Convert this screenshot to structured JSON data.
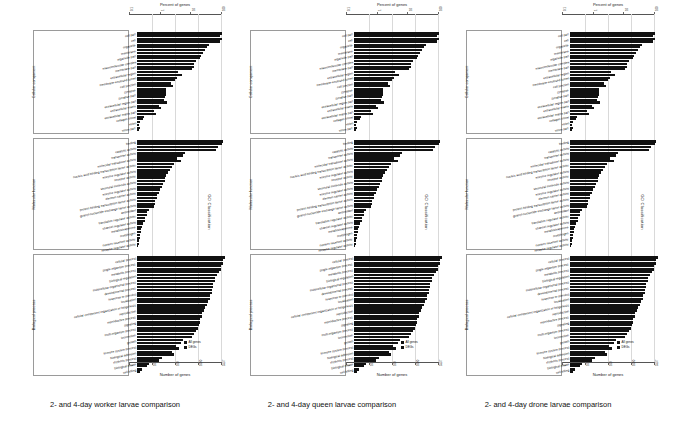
{
  "figure": {
    "panels": [
      {
        "caption": "2- and 4-day worker larvae comparison"
      },
      {
        "caption": "2- and 4-day queen larvae comparison"
      },
      {
        "caption": "2- and 4-day drone larvae comparison"
      }
    ],
    "axis_titles": {
      "top": "Percent of genes",
      "bottom": "Number of genes",
      "right": "GO Classification"
    },
    "group_labels": [
      "Cellular component",
      "Molecular function",
      "Biological process"
    ],
    "legend": [
      {
        "label": "All genes",
        "color": "#111111"
      },
      {
        "label": "DEGs",
        "color": "#111111"
      }
    ]
  },
  "chart_data": {
    "type": "bar",
    "title": "",
    "xlabel": "Number of genes",
    "ylabel": "GO Classification",
    "orientation": "horizontal",
    "top_axis": {
      "label": "Percent of genes",
      "ticks": [
        "0.1",
        "1",
        "10",
        "100"
      ],
      "scale": "log"
    },
    "bottom_axis": {
      "label": "Number of genes",
      "ticks": [
        "1",
        "10",
        "100",
        "1000",
        "5537"
      ],
      "scale": "log"
    },
    "legend": [
      "All genes",
      "DEGs"
    ],
    "legend_position": "bottom-right",
    "grid": true,
    "groups": [
      {
        "name": "Cellular component",
        "categories": [
          "cell part",
          "cell",
          "organelle",
          "membrane",
          "organelle part",
          "macromolecular complex",
          "membrane part",
          "extracellular region",
          "membrane-enclosed lumen",
          "cell junction",
          "synapse",
          "synapse part",
          "extracellular region part",
          "extracellular matrix",
          "extracellular matrix part",
          "collagen trimer",
          "virion",
          "virion part"
        ],
        "series": [
          {
            "name": "All genes",
            "values": [
              92,
              92,
              78,
              74,
              70,
              64,
              62,
              45,
              43,
              37,
              32,
              31,
              29,
              24,
              19,
              8,
              3,
              3
            ]
          },
          {
            "name": "DEGs",
            "values": [
              90,
              90,
              76,
              72,
              68,
              62,
              60,
              49,
              41,
              39,
              31,
              30,
              33,
              26,
              21,
              6,
              2,
              2
            ]
          }
        ]
      },
      {
        "name": "Molecular function",
        "categories": [
          "binding",
          "catalytic activity",
          "transporter activity",
          "molecular transducer activity",
          "nucleic acid binding transcription factor activity",
          "enzyme regulator activity",
          "receptor activity",
          "structural molecule activity",
          "enzyme regulator activity",
          "electron carrier activity",
          "protein binding transcription factor activity",
          "guanyl-nucleotide exchange factor activity",
          "antioxidant",
          "translation regulator activity",
          "channel regulator activity",
          "metallochaperone",
          "morphogen",
          "nutrient reservoir activity",
          "receptor regulator activity"
        ],
        "series": [
          {
            "name": "All genes",
            "values": [
              94,
              88,
              52,
              44,
              40,
              36,
              32,
              30,
              27,
              24,
              22,
              20,
              13,
              11,
              9,
              5,
              4,
              3,
              2
            ]
          },
          {
            "name": "DEGs",
            "values": [
              92,
              86,
              50,
              48,
              38,
              34,
              30,
              28,
              25,
              22,
              20,
              18,
              11,
              9,
              7,
              4,
              3,
              2,
              1
            ]
          }
        ]
      },
      {
        "name": "Biological process",
        "categories": [
          "cellular process",
          "single-organism process",
          "metabolic process",
          "biological regulation",
          "multicellular organismal process",
          "developmental process",
          "response to stimulus",
          "localization",
          "cellular component organization or biogenesis",
          "reproduction",
          "reproductive process",
          "signaling",
          "multi-organism process",
          "locomotion",
          "growth",
          "immune system process",
          "biological adhesion",
          "rhythmic process",
          "biological phase",
          "cell killing"
        ],
        "series": [
          {
            "name": "All genes",
            "values": [
              96,
              93,
              91,
              87,
              85,
              83,
              81,
              79,
              76,
              73,
              71,
              69,
              66,
              62,
              50,
              42,
              38,
              27,
              13,
              5
            ]
          },
          {
            "name": "DEGs",
            "values": [
              94,
              91,
              89,
              85,
              83,
              81,
              79,
              77,
              74,
              71,
              69,
              67,
              64,
              60,
              48,
              46,
              40,
              24,
              11,
              3
            ]
          }
        ]
      }
    ]
  }
}
